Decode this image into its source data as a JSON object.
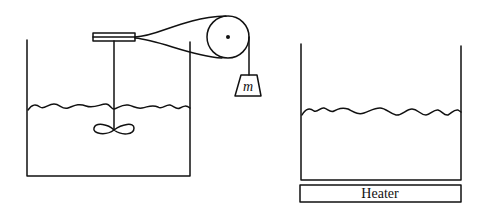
{
  "diagram": {
    "title": "",
    "left_setup": {
      "description": "Falling mass drives paddle wheel in insulated water container via pulley",
      "mass_label": "m",
      "components": [
        "container",
        "water",
        "paddle-wheel",
        "shaft",
        "drum",
        "rope",
        "pulley",
        "hanging-mass"
      ]
    },
    "right_setup": {
      "description": "Water container heated from below",
      "heater_label": "Heater",
      "components": [
        "container",
        "water",
        "heater"
      ]
    },
    "colors": {
      "line": "#111111",
      "background": "#ffffff"
    }
  }
}
